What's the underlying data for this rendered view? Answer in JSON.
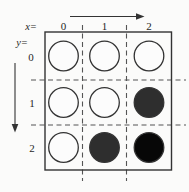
{
  "figure": {
    "axis": {
      "x_label": "x=",
      "y_label": "y="
    },
    "columns": [
      "0",
      "1",
      "2"
    ],
    "rows": [
      "0",
      "1",
      "2"
    ],
    "cells": [
      [
        "open",
        "open",
        "open"
      ],
      [
        "open",
        "open",
        "filled-dark"
      ],
      [
        "open",
        "filled-dark",
        "filled-black"
      ]
    ],
    "colors": {
      "line": "#333333",
      "dash": "#555555",
      "background": "#fbfbfa",
      "open_fill": "#fcfcfc",
      "filled_dark": "#2e2e2e",
      "filled_black": "#070707"
    },
    "layout": {
      "box": {
        "x1": 45,
        "y1": 32,
        "x2": 171.5,
        "y2": 170
      },
      "col_dividers_x": [
        82.5,
        126.5
      ],
      "row_dividers_y": [
        80,
        125
      ],
      "dash_v_extent": [
        25,
        181
      ],
      "dash_h_extent": [
        31,
        186
      ],
      "col_centers_x": [
        63.5,
        104.5,
        149
      ],
      "row_centers_y": [
        56,
        102.5,
        147.5
      ],
      "circle_radius": 14.8
    }
  }
}
